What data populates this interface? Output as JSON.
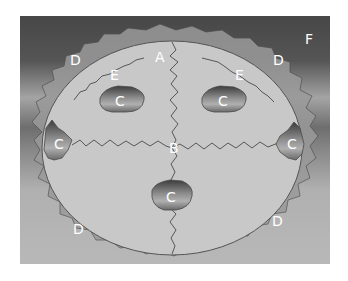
{
  "diagram": {
    "labels": {
      "A": "A",
      "B": "B",
      "C": "C",
      "D": "D",
      "E": "E",
      "F": "F"
    },
    "label_positions": [
      {
        "id": "A",
        "x": 160,
        "y": 60
      },
      {
        "id": "B",
        "x": 174,
        "y": 150
      },
      {
        "id": "C_upper_left",
        "x": 120,
        "y": 104
      },
      {
        "id": "C_upper_right",
        "x": 224,
        "y": 104
      },
      {
        "id": "C_left",
        "x": 59,
        "y": 147
      },
      {
        "id": "C_right",
        "x": 292,
        "y": 147
      },
      {
        "id": "C_bottom",
        "x": 172,
        "y": 200
      },
      {
        "id": "D_upper_left",
        "x": 75,
        "y": 63
      },
      {
        "id": "D_upper_right",
        "x": 278,
        "y": 63
      },
      {
        "id": "D_lower_left",
        "x": 78,
        "y": 232
      },
      {
        "id": "D_lower_right",
        "x": 277,
        "y": 224
      },
      {
        "id": "E_left",
        "x": 115,
        "y": 78
      },
      {
        "id": "E_right",
        "x": 240,
        "y": 78
      },
      {
        "id": "F",
        "x": 310,
        "y": 42
      }
    ],
    "colors": {
      "background_top": "#4a4a4a",
      "background_mid_light": "#a2a2a2",
      "background_mid_dark": "#737373",
      "background_bottom": "#b6b6b6",
      "ellipse_fill": "#c9c9c9",
      "outline": "#505050",
      "label_text": "#ffffff"
    }
  }
}
